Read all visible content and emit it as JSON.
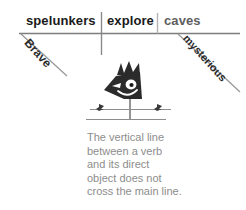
{
  "diagram": {
    "type": "sentence-diagram",
    "sentence": "Brave spelunkers explore mysterious caves.",
    "base_line": {
      "subject": "spelunkers",
      "verb": "explore",
      "direct_object": "caves"
    },
    "modifiers": {
      "subject_modifier": "Brave",
      "object_modifier": "mysterious"
    },
    "colors": {
      "main_text": "#1a1a1a",
      "object_text": "#5e5e5e",
      "modifier_text": "#2b2b2b",
      "rule_line": "#7d7d7d",
      "caption_text": "#8d8d8d",
      "figure_fill": "#2b2b2b"
    }
  },
  "illustration": {
    "name": "crow-on-scarecrow-post",
    "parts": [
      "crow-head",
      "spiky-crest",
      "eye",
      "beak",
      "smile",
      "cross-bar",
      "post",
      "left-bird",
      "right-bird",
      "ground-line"
    ]
  },
  "caption": {
    "lines": [
      "The vertical line",
      "between a verb",
      "and its direct",
      "object does not",
      "cross the main line."
    ],
    "full_text": "The vertical line between a verb and its direct object does not cross the main line."
  }
}
